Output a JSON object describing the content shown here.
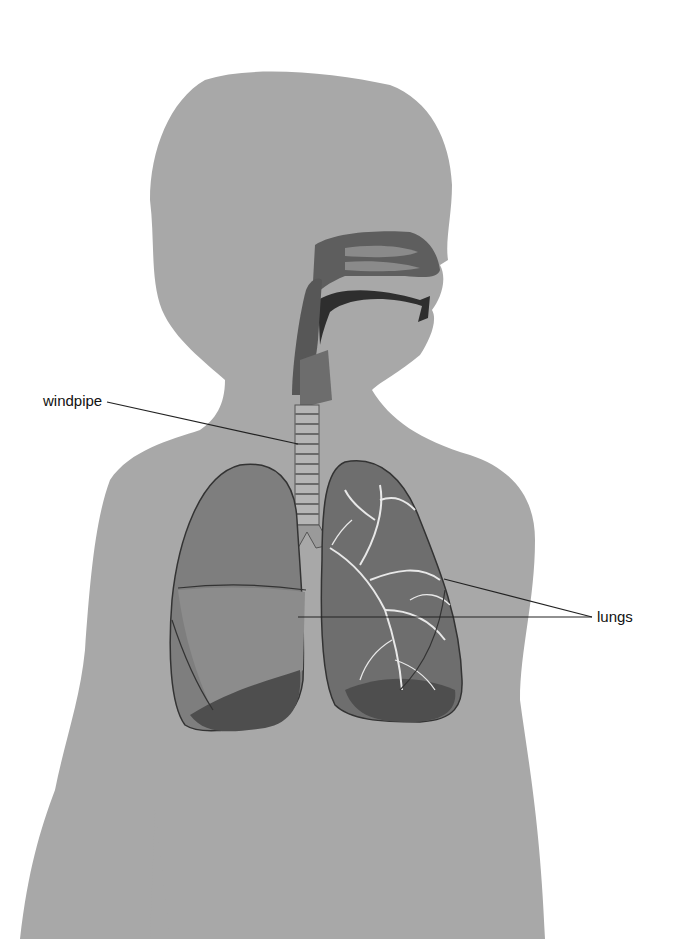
{
  "diagram": {
    "labels": [
      {
        "id": "windpipe",
        "text": "windpipe"
      },
      {
        "id": "lungs",
        "text": "lungs"
      }
    ],
    "colors": {
      "background": "#ffffff",
      "body_silhouette": "#a8a8a8",
      "airway": "#5a5a5a",
      "lung_fill": "#7c7c7c",
      "lung_dark": "#4e4e4e",
      "bronchi": "#e8e8e8",
      "leader_line": "#222222",
      "label_text": "#111111"
    }
  }
}
